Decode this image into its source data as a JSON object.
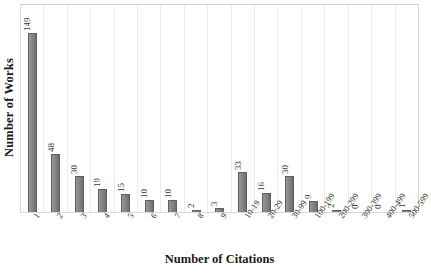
{
  "chart_data": {
    "type": "bar",
    "title": "",
    "xlabel": "Number of Citations",
    "ylabel": "Number of Works",
    "categories": [
      "1",
      "2",
      "3",
      "4",
      "5",
      "6",
      "7",
      "8",
      "9",
      "10-19",
      "20-29",
      "30-99",
      "100-199",
      "200-299",
      "300-399",
      "400-499",
      "500-599"
    ],
    "values": [
      149,
      48,
      30,
      19,
      15,
      10,
      10,
      2,
      3,
      33,
      16,
      30,
      9,
      2,
      0,
      0,
      1
    ],
    "ylim": [
      0,
      149
    ],
    "grid": "vertical-category-separators",
    "legend": "none",
    "bar_color": "#808080",
    "bar_edge_color": "#5f5f5f",
    "data_labels": [
      "149",
      "48",
      "30",
      "19",
      "15",
      "10",
      "10",
      "2",
      "3",
      "33",
      "16",
      "30",
      "9",
      "2",
      "0",
      "0",
      "1"
    ],
    "data_label_rotation": -90,
    "tick_label_rotation": -55
  },
  "frame": {
    "border_color": "#d9d9d9",
    "background": "#ffffff"
  }
}
